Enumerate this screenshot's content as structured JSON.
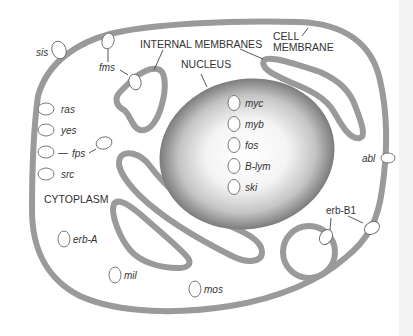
{
  "diagram": {
    "type": "cell-diagram",
    "structures": {
      "cell_membrane": "CELL MEMBRANE",
      "cell_membrane_line1": "CELL",
      "cell_membrane_line2": "MEMBRANE",
      "internal_membranes": "INTERNAL MEMBRANES",
      "nucleus": "NUCLEUS",
      "cytoplasm": "CYTOPLASM"
    },
    "genes": {
      "nucleus": [
        "myc",
        "myb",
        "fos",
        "B-lym",
        "ski"
      ],
      "cell_membrane": [
        "fms",
        "abl",
        "erb-B1"
      ],
      "internal_membrane": [
        "fms",
        "erb-B1"
      ],
      "cytoplasm": [
        "sis",
        "ras",
        "yes",
        "fps",
        "src",
        "erb-A",
        "mil",
        "mos"
      ]
    },
    "labels": {
      "sis": "sis",
      "fms": "fms",
      "ras": "ras",
      "yes": "yes",
      "fps": "fps",
      "fps_dash": "—",
      "src": "src",
      "erbA": "erb-A",
      "mil": "mil",
      "mos": "mos",
      "myc": "myc",
      "myb": "myb",
      "fos": "fos",
      "blym": "B-lym",
      "ski": "ski",
      "abl": "abl",
      "erbB1": "erb-B1"
    },
    "colors": {
      "membrane": "#9a9a9a",
      "nucleus_edge": "#6e6e6e",
      "nucleus_center": "#ffffff",
      "text": "#333333",
      "background": "#ffffff"
    }
  }
}
